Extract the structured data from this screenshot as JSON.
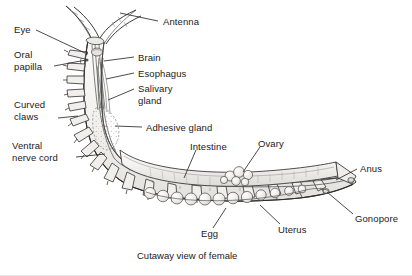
{
  "figure": {
    "title_caption": "Cutaway view of female",
    "colors": {
      "ink": "#1a1a1a",
      "line": "#333333",
      "body_fill": "#f2f1ef",
      "organ_fill": "#e8e7e4",
      "background": "#ffffff"
    },
    "labels": [
      {
        "id": "antenna",
        "text": "Antenna",
        "x": 163,
        "y": 16,
        "leader": [
          [
            158,
            21
          ],
          [
            120,
            13
          ]
        ]
      },
      {
        "id": "eye",
        "text": "Eye",
        "x": 14,
        "y": 24,
        "leader": [
          [
            36,
            30
          ],
          [
            85,
            53
          ]
        ]
      },
      {
        "id": "oral-papilla",
        "text": "Oral\npapilla",
        "x": 14,
        "y": 49,
        "leader": [
          [
            54,
            66
          ],
          [
            86,
            60
          ]
        ]
      },
      {
        "id": "brain",
        "text": "Brain",
        "x": 138,
        "y": 52,
        "leader": [
          [
            134,
            57
          ],
          [
            104,
            61
          ]
        ]
      },
      {
        "id": "esophagus",
        "text": "Esophagus",
        "x": 138,
        "y": 68,
        "leader": [
          [
            134,
            73
          ],
          [
            106,
            79
          ]
        ]
      },
      {
        "id": "salivary-gland",
        "text": "Salivary\ngland",
        "x": 138,
        "y": 83,
        "leader": [
          [
            134,
            89
          ],
          [
            108,
            100
          ]
        ]
      },
      {
        "id": "curved-claws",
        "text": "Curved\nclaws",
        "x": 14,
        "y": 99,
        "leader": [
          [
            58,
            118
          ],
          [
            78,
            116
          ]
        ]
      },
      {
        "id": "adhesive-gland",
        "text": "Adhesive gland",
        "x": 146,
        "y": 122,
        "leader": [
          [
            142,
            127
          ],
          [
            115,
            126
          ]
        ]
      },
      {
        "id": "ventral-nerve-cord",
        "text": "Ventral\nnerve cord",
        "x": 12,
        "y": 140,
        "leader": [
          [
            76,
            157
          ],
          [
            105,
            154
          ]
        ]
      },
      {
        "id": "intestine",
        "text": "Intestine",
        "x": 190,
        "y": 141,
        "leader": [
          [
            196,
            150
          ],
          [
            184,
            178
          ]
        ]
      },
      {
        "id": "ovary",
        "text": "Ovary",
        "x": 258,
        "y": 138,
        "leader": [
          [
            260,
            147
          ],
          [
            243,
            172
          ]
        ]
      },
      {
        "id": "anus",
        "text": "Anus",
        "x": 360,
        "y": 163,
        "leader": [
          [
            357,
            169
          ],
          [
            336,
            180
          ]
        ]
      },
      {
        "id": "gonopore",
        "text": "Gonopore",
        "x": 355,
        "y": 213,
        "leader": [
          [
            353,
            214
          ],
          [
            327,
            192
          ]
        ]
      },
      {
        "id": "egg",
        "text": "Egg",
        "x": 201,
        "y": 228,
        "leader": [
          [
            213,
            228
          ],
          [
            226,
            208
          ]
        ]
      },
      {
        "id": "uterus",
        "text": "Uterus",
        "x": 278,
        "y": 224,
        "leader": [
          [
            280,
            224
          ],
          [
            260,
            205
          ]
        ]
      }
    ]
  }
}
